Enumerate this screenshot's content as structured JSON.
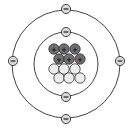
{
  "diagram": {
    "element": "Carbon",
    "colors": {
      "orbit": "#444444",
      "proton_fill": "#6e6e6e",
      "neutron_fill": "#ededed",
      "electron_fill": "#d8d8d8",
      "stroke": "#333333"
    },
    "nucleus": {
      "protons": [
        {
          "x": 54,
          "y": 49,
          "symbol": "+"
        },
        {
          "x": 64,
          "y": 49,
          "symbol": "+"
        },
        {
          "x": 75,
          "y": 49,
          "symbol": "+"
        },
        {
          "x": 59,
          "y": 59,
          "symbol": "+"
        },
        {
          "x": 69,
          "y": 59,
          "symbol": "+"
        },
        {
          "x": 80,
          "y": 59,
          "symbol": "+"
        }
      ],
      "neutrons": [
        {
          "x": 54,
          "y": 69
        },
        {
          "x": 64,
          "y": 69
        },
        {
          "x": 75,
          "y": 69
        },
        {
          "x": 59,
          "y": 78
        },
        {
          "x": 69,
          "y": 78
        },
        {
          "x": 80,
          "y": 78
        }
      ]
    },
    "orbits": [
      {
        "name": "inner-shell",
        "cx": 66,
        "cy": 64,
        "r": 32,
        "electrons": [
          {
            "x": 66,
            "y": 32,
            "symbol": "−"
          },
          {
            "x": 66,
            "y": 97,
            "symbol": "−"
          }
        ]
      },
      {
        "name": "outer-shell",
        "cx": 66,
        "cy": 64,
        "r": 54,
        "electrons": [
          {
            "x": 66,
            "y": 9,
            "symbol": "−"
          },
          {
            "x": 66,
            "y": 119,
            "symbol": "−"
          },
          {
            "x": 13,
            "y": 61,
            "symbol": "−"
          },
          {
            "x": 120,
            "y": 61,
            "symbol": "−"
          }
        ]
      }
    ]
  }
}
